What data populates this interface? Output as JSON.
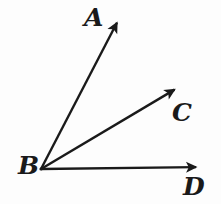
{
  "figure": {
    "type": "geometry-diagram",
    "background_color": "#fdfdfd",
    "stroke_color": "#1a1a1a",
    "stroke_width": 2.4,
    "width": 221,
    "height": 204
  },
  "labels": {
    "a": "A",
    "b": "B",
    "c": "C",
    "d": "D"
  },
  "geometry": {
    "vertex": {
      "name": "B",
      "x": 41,
      "y": 169
    },
    "rays": [
      {
        "name": "ray-BA",
        "label": "A",
        "from_x": 41,
        "from_y": 169,
        "to_x": 122,
        "to_y": 13,
        "label_x": 84,
        "label_y": 5
      },
      {
        "name": "ray-BC",
        "label": "C",
        "from_x": 41,
        "from_y": 169,
        "to_x": 184,
        "to_y": 84,
        "label_x": 172,
        "label_y": 100
      },
      {
        "name": "ray-BD",
        "label": "D",
        "from_x": 41,
        "from_y": 169,
        "to_x": 207,
        "to_y": 167,
        "label_x": 183,
        "label_y": 174
      }
    ]
  }
}
